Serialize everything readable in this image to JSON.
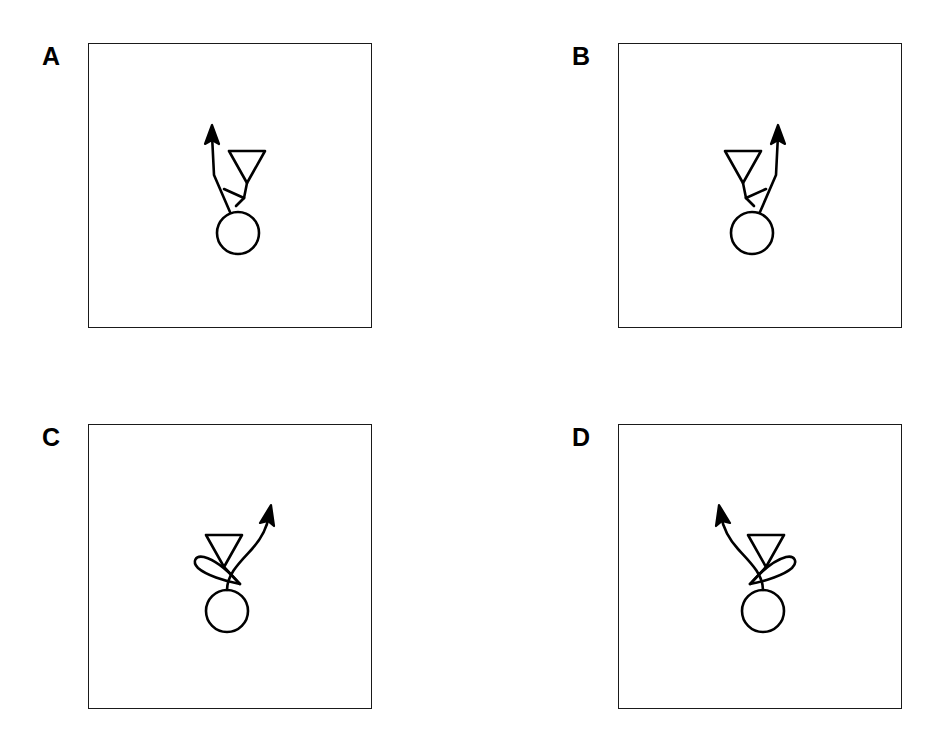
{
  "figure": {
    "type": "multi-panel-schematic",
    "background_color": "#ffffff",
    "stroke_color": "#000000",
    "frame_color": "#1a1a1a",
    "panel_count": 4,
    "layout": "2x2 grid",
    "panels": [
      {
        "id": "a",
        "label": "A",
        "description": "Straight kinked path: soma circle at bottom, line rises up and to the left terminating in an upward arrowhead; downward-pointing open triangle at upper right with a short stem ending in a small hook that crosses the line.",
        "arrow_direction": "up-left",
        "triangle_side": "right",
        "path_style": "straight-kinked",
        "has_loop": false,
        "elements": [
          "soma-circle",
          "axon-line",
          "arrowhead",
          "downward-triangle",
          "hook-barb"
        ]
      },
      {
        "id": "b",
        "label": "B",
        "description": "Mirror image of panel A: soma circle at bottom, line rises up and to the right terminating in an upward arrowhead; downward-pointing open triangle at upper left with a short stem ending in a small hook that crosses the line.",
        "arrow_direction": "up-right",
        "triangle_side": "left",
        "path_style": "straight-kinked",
        "has_loop": false,
        "elements": [
          "soma-circle",
          "axon-line",
          "arrowhead",
          "downward-triangle",
          "hook-barb"
        ]
      },
      {
        "id": "c",
        "label": "C",
        "description": "Curved path with loop: soma circle at bottom, curve sweeps up and to the right terminating in an arrowhead; downward-pointing open triangle above with a stem that forms a teardrop loop curling to the left across the curve.",
        "arrow_direction": "up-right",
        "triangle_side": "left-of-curve",
        "loop_side": "left",
        "path_style": "curved",
        "has_loop": true,
        "elements": [
          "soma-circle",
          "axon-curve",
          "arrowhead",
          "downward-triangle",
          "teardrop-loop"
        ]
      },
      {
        "id": "d",
        "label": "D",
        "description": "Mirror image of panel C: soma circle at bottom, curve sweeps up and to the left terminating in an arrowhead; downward-pointing open triangle above with a stem that forms a teardrop loop curling to the right across the curve.",
        "arrow_direction": "up-left",
        "triangle_side": "right-of-curve",
        "loop_side": "right",
        "path_style": "curved",
        "has_loop": true,
        "elements": [
          "soma-circle",
          "axon-curve",
          "arrowhead",
          "downward-triangle",
          "teardrop-loop"
        ]
      }
    ]
  }
}
